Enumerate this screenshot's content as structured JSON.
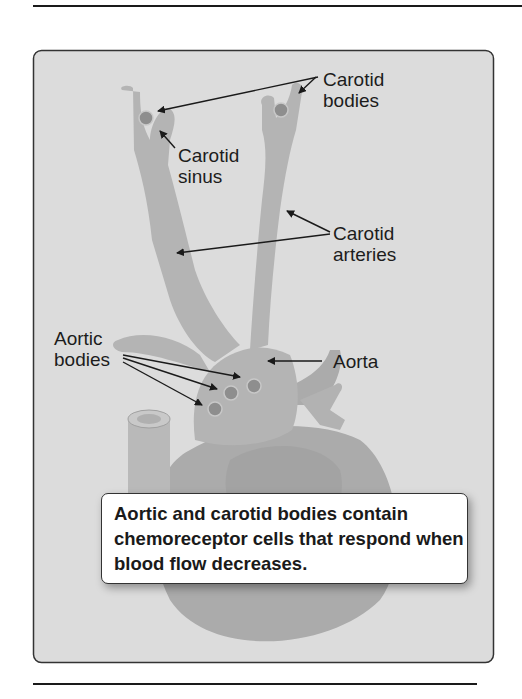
{
  "figure": {
    "labels": {
      "carotid_bodies": "Carotid\nbodies",
      "carotid_sinus": "Carotid\nsinus",
      "carotid_arteries": "Carotid\narteries",
      "aortic_bodies": "Aortic\nbodies",
      "aorta": "Aorta"
    },
    "callout": "Aortic and carotid bodies contain chemoreceptor cells that respond when blood flow decreases.",
    "colors": {
      "panel_background": "#dcdcdc",
      "vessel": "#b4b4b4",
      "heart": "#a9a9a9",
      "body_dot": "#8c8c8c",
      "border": "#333333"
    }
  }
}
